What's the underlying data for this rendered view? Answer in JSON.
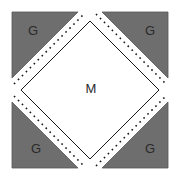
{
  "diagram": {
    "center_label": "M",
    "corner_labels": {
      "top_left": "G",
      "top_right": "G",
      "bottom_left": "G",
      "bottom_right": "G"
    },
    "colors": {
      "corner_fill": "#6e6e6e",
      "center_fill": "#ffffff",
      "outline": "#1a1a1a",
      "dash": "#1a1a1a"
    }
  }
}
